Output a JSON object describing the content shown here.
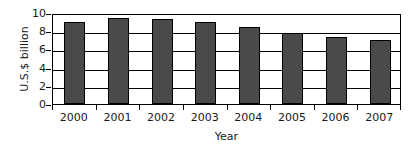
{
  "chart_data": {
    "type": "bar",
    "title": "",
    "xlabel": "Year",
    "ylabel": "U.S.$ billion",
    "categories": [
      "2000",
      "2001",
      "2002",
      "2003",
      "2004",
      "2005",
      "2006",
      "2007"
    ],
    "values": [
      9.0,
      9.4,
      9.3,
      9.0,
      8.5,
      7.8,
      7.4,
      7.0
    ],
    "ylim": [
      0,
      10
    ],
    "ytick_labels": [
      "0",
      "2",
      "4",
      "6",
      "8",
      "10"
    ],
    "ytick_values": [
      0,
      2,
      4,
      6,
      8,
      10
    ],
    "grid": "horizontal",
    "legend": "none",
    "bar_color": "#4a4a4a",
    "bar_edge_color": "#000000",
    "axis_color": "#000000",
    "background_color": "#ffffff"
  }
}
